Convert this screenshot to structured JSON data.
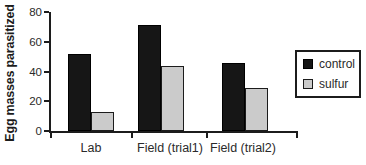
{
  "chart_data": {
    "type": "bar",
    "ylabel": "Egg masses parasitized",
    "xlabel": "",
    "ylim": [
      0,
      80
    ],
    "yticks": [
      0,
      20,
      40,
      60,
      80
    ],
    "grid": false,
    "categories": [
      "Lab",
      "Field (trial1)",
      "Field (trial2)"
    ],
    "series": [
      {
        "name": "control",
        "color": "#161616",
        "values": [
          52,
          71,
          46
        ]
      },
      {
        "name": "sulfur",
        "color": "#cbcbcb",
        "values": [
          13,
          44,
          29
        ]
      }
    ],
    "legend": {
      "position": "right",
      "entries": [
        "control",
        "sulfur"
      ]
    }
  }
}
